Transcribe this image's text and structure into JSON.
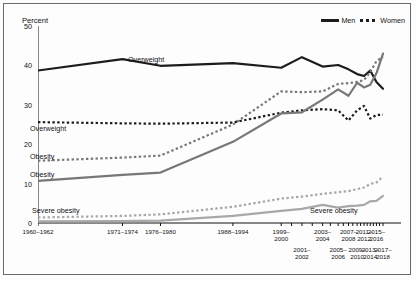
{
  "figure": {
    "ylabel": "Percent",
    "legend": [
      {
        "label": "Men",
        "style": "solid"
      },
      {
        "label": "Women",
        "style": "dashed"
      }
    ],
    "yticks": [
      "0",
      "10",
      "20",
      "30",
      "40",
      "50"
    ],
    "series_labels": [
      {
        "id": "men-overweight",
        "text": "Overweight"
      },
      {
        "id": "women-overweight",
        "text": "Overweight"
      },
      {
        "id": "women-obesity",
        "text": "Obesity"
      },
      {
        "id": "men-obesity",
        "text": "Obesity"
      },
      {
        "id": "women-severe-obesity",
        "text": "Severe obesity"
      },
      {
        "id": "men-severe-obesity",
        "text": "Severe obesity"
      }
    ],
    "colors": {
      "dark": "#1c1c1c",
      "mid_gray": "#777777",
      "light_gray": "#a8a8a8",
      "axis": "#111111",
      "border": "#6a6a6a"
    }
  },
  "chart_data": {
    "type": "line",
    "title": "",
    "xlabel": "",
    "ylabel": "Percent",
    "ylim": [
      0,
      50
    ],
    "yticks": [
      0,
      10,
      20,
      30,
      40,
      50
    ],
    "grid": false,
    "legend_position": "top-right",
    "categories": [
      "1960–1962",
      "1971–1974",
      "1976–1980",
      "1988–1994",
      "1999–2000",
      "2001–2002",
      "2003–2004",
      "2005–2006",
      "2007–2008",
      "2009–2010",
      "2011–2012",
      "2013–2014",
      "2015–2016",
      "2017–2018"
    ],
    "x_positions": [
      0.0,
      0.245,
      0.355,
      0.565,
      0.705,
      0.765,
      0.825,
      0.87,
      0.9,
      0.925,
      0.945,
      0.963,
      0.981,
      1.0
    ],
    "series": [
      {
        "name": "Overweight, men",
        "group": "Men",
        "measure": "Overweight",
        "style": "solid",
        "color": "#1c1c1c",
        "values": [
          38.7,
          41.6,
          39.9,
          40.6,
          39.4,
          42.1,
          39.7,
          40.1,
          39.0,
          37.8,
          37.3,
          38.7,
          35.8,
          34.1
        ]
      },
      {
        "name": "Overweight, women",
        "group": "Women",
        "measure": "Overweight",
        "style": "dashed",
        "color": "#1c1c1c",
        "values": [
          25.6,
          25.3,
          25.2,
          25.5,
          28.0,
          28.6,
          28.9,
          28.6,
          26.0,
          28.6,
          29.7,
          26.5,
          27.4,
          27.5
        ]
      },
      {
        "name": "Obesity, men",
        "group": "Men",
        "measure": "Obesity",
        "style": "solid",
        "color": "#777777",
        "values": [
          10.7,
          12.2,
          12.8,
          20.6,
          27.8,
          28.1,
          31.3,
          33.9,
          32.3,
          35.6,
          34.4,
          35.1,
          38.0,
          43.0
        ]
      },
      {
        "name": "Obesity, women",
        "group": "Women",
        "measure": "Obesity",
        "style": "dashed",
        "color": "#777777",
        "values": [
          15.8,
          16.6,
          17.1,
          25.0,
          33.4,
          33.2,
          33.4,
          35.3,
          35.5,
          35.8,
          36.3,
          38.3,
          41.1,
          42.1
        ]
      },
      {
        "name": "Severe obesity, men",
        "group": "Men",
        "measure": "Severe obesity",
        "style": "solid",
        "color": "#a8a8a8",
        "values": [
          0.4,
          0.5,
          0.6,
          1.8,
          3.1,
          3.6,
          4.6,
          3.9,
          4.3,
          4.4,
          4.6,
          5.5,
          5.6,
          6.9
        ]
      },
      {
        "name": "Severe obesity, women",
        "group": "Women",
        "measure": "Severe obesity",
        "style": "dashed",
        "color": "#a8a8a8",
        "values": [
          1.4,
          1.8,
          2.2,
          4.1,
          6.2,
          6.7,
          7.4,
          7.8,
          8.1,
          8.6,
          9.0,
          9.9,
          10.3,
          11.8
        ]
      }
    ]
  },
  "xaxis": {
    "row_top": [
      "1960–1962",
      "1971–1974",
      "1976–1980",
      "1988–1994",
      "1999–\n2000",
      "2003–\n2004",
      "2007–\n2008",
      "2011–\n2012",
      "2015–\n2016"
    ],
    "row_bottom": [
      "2001–\n2002",
      "2005–\n2006",
      "2009–\n2010",
      "2013–\n2014",
      "2017–\n2018"
    ]
  }
}
